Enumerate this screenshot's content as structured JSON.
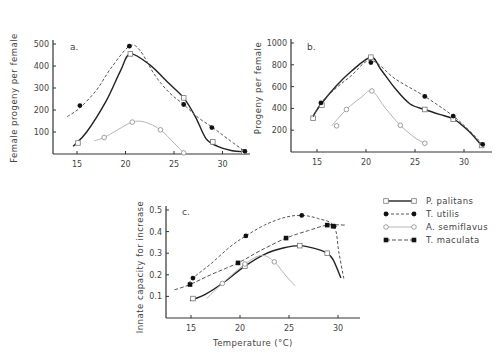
{
  "legend": [
    {
      "key": "P_palitans",
      "label": "P. palitans",
      "line": "solid",
      "marker": "open-square",
      "color": "#222222"
    },
    {
      "key": "T_utilis",
      "label": "T. utilis",
      "line": "dashed",
      "marker": "filled-circle",
      "color": "#555555"
    },
    {
      "key": "A_semiflavus",
      "label": "A. semiflavus",
      "line": "dotted",
      "marker": "open-circle",
      "color": "#aaaaaa"
    },
    {
      "key": "T_maculata",
      "label": "T. maculata",
      "line": "dashed",
      "marker": "filled-square",
      "color": "#555555"
    }
  ],
  "shared_xlabel": "Temperature (°C)",
  "chart_data": [
    {
      "panel": "a.",
      "type": "line",
      "title": "",
      "xlabel": "",
      "ylabel": "Female progeny per female",
      "xlim": [
        13,
        32.5
      ],
      "ylim": [
        0,
        500
      ],
      "xticks": [
        15,
        20,
        25,
        30
      ],
      "yticks": [
        100,
        200,
        300,
        400,
        500
      ],
      "grid": false,
      "series": [
        {
          "name": "P. palitans",
          "points": [
            [
              15.1,
              50
            ],
            [
              20.5,
              455
            ],
            [
              26.0,
              255
            ],
            [
              29.0,
              55
            ],
            [
              32.2,
              10
            ]
          ],
          "curve": [
            [
              14.6,
              35
            ],
            [
              16,
              100
            ],
            [
              18,
              240
            ],
            [
              19.5,
              380
            ],
            [
              20.5,
              455
            ],
            [
              22.5,
              405
            ],
            [
              24.5,
              320
            ],
            [
              26,
              255
            ],
            [
              27.2,
              170
            ],
            [
              28.3,
              70
            ],
            [
              29.5,
              35
            ],
            [
              31,
              15
            ],
            [
              32.2,
              10
            ]
          ]
        },
        {
          "name": "T. utilis",
          "points": [
            [
              15.3,
              220
            ],
            [
              20.4,
              490
            ],
            [
              26.0,
              225
            ],
            [
              28.9,
              120
            ],
            [
              32.3,
              12
            ]
          ],
          "curve": [
            [
              14,
              170
            ],
            [
              15.3,
              210
            ],
            [
              17,
              290
            ],
            [
              18.5,
              390
            ],
            [
              20.4,
              490
            ],
            [
              21.5,
              470
            ],
            [
              23,
              360
            ],
            [
              24.5,
              280
            ],
            [
              26,
              225
            ],
            [
              27.5,
              165
            ],
            [
              29,
              120
            ],
            [
              30.5,
              70
            ],
            [
              32.3,
              12
            ]
          ]
        },
        {
          "name": "A. semiflavus",
          "points": [
            [
              17.8,
              75
            ],
            [
              20.7,
              145
            ],
            [
              23.6,
              110
            ],
            [
              26.0,
              5
            ]
          ],
          "curve": [
            [
              16.8,
              60
            ],
            [
              17.8,
              75
            ],
            [
              19.2,
              110
            ],
            [
              20.7,
              145
            ],
            [
              22,
              145
            ],
            [
              23.6,
              110
            ],
            [
              25,
              50
            ],
            [
              26,
              5
            ]
          ]
        }
      ]
    },
    {
      "panel": "b.",
      "type": "line",
      "title": "",
      "xlabel": "",
      "ylabel": "Progeny per female",
      "xlim": [
        12.5,
        32.5
      ],
      "ylim": [
        0,
        1000
      ],
      "xticks": [
        15,
        20,
        25,
        30
      ],
      "yticks": [
        200,
        400,
        600,
        800,
        1000
      ],
      "grid": false,
      "series": [
        {
          "name": "P. palitans",
          "points": [
            [
              14.6,
              310
            ],
            [
              15.5,
              430
            ],
            [
              20.5,
              870
            ],
            [
              26.0,
              390
            ],
            [
              28.9,
              300
            ],
            [
              31.8,
              60
            ]
          ],
          "curve": [
            [
              14.6,
              330
            ],
            [
              15.5,
              450
            ],
            [
              17,
              610
            ],
            [
              18.5,
              740
            ],
            [
              20.5,
              870
            ],
            [
              21.5,
              760
            ],
            [
              23,
              580
            ],
            [
              24.5,
              440
            ],
            [
              26,
              390
            ],
            [
              27.5,
              345
            ],
            [
              29,
              300
            ],
            [
              30.5,
              190
            ],
            [
              31.8,
              60
            ]
          ]
        },
        {
          "name": "T. utilis",
          "points": [
            [
              15.4,
              450
            ],
            [
              20.5,
              820
            ],
            [
              26.0,
              510
            ],
            [
              28.9,
              330
            ],
            [
              31.9,
              70
            ]
          ],
          "curve": [
            [
              14.6,
              320
            ],
            [
              15.4,
              450
            ],
            [
              17,
              590
            ],
            [
              18.5,
              700
            ],
            [
              20.5,
              840
            ],
            [
              23,
              670
            ],
            [
              26,
              510
            ],
            [
              28.9,
              330
            ],
            [
              30.5,
              200
            ],
            [
              31.9,
              70
            ]
          ]
        },
        {
          "name": "A. semiflavus",
          "points": [
            [
              17.0,
              240
            ],
            [
              18.0,
              390
            ],
            [
              20.6,
              560
            ],
            [
              23.5,
              245
            ],
            [
              26.0,
              80
            ]
          ],
          "curve": [
            [
              16.5,
              240
            ],
            [
              18,
              390
            ],
            [
              19.5,
              500
            ],
            [
              20.6,
              560
            ],
            [
              22,
              400
            ],
            [
              23.5,
              245
            ],
            [
              25,
              130
            ],
            [
              26,
              80
            ]
          ]
        }
      ]
    },
    {
      "panel": "c.",
      "type": "line",
      "title": "",
      "xlabel": "Temperature (°C)",
      "ylabel": "Innate capacity for increase",
      "xlim": [
        12.5,
        32.5
      ],
      "ylim": [
        0,
        0.5
      ],
      "xticks": [
        15,
        20,
        25,
        30
      ],
      "yticks": [
        0.1,
        0.2,
        0.3,
        0.4,
        0.5
      ],
      "grid": false,
      "series": [
        {
          "name": "P. palitans",
          "points": [
            [
              15.2,
              0.09
            ],
            [
              20.5,
              0.24
            ],
            [
              26.1,
              0.335
            ],
            [
              28.9,
              0.3
            ]
          ],
          "curve": [
            [
              14.9,
              0.08
            ],
            [
              16.5,
              0.11
            ],
            [
              18.5,
              0.17
            ],
            [
              20.5,
              0.24
            ],
            [
              22.5,
              0.295
            ],
            [
              24.5,
              0.325
            ],
            [
              26.1,
              0.335
            ],
            [
              27.8,
              0.32
            ],
            [
              28.9,
              0.3
            ],
            [
              29.5,
              0.27
            ],
            [
              30.3,
              0.185
            ]
          ]
        },
        {
          "name": "T. utilis",
          "points": [
            [
              15.2,
              0.185
            ],
            [
              20.6,
              0.38
            ],
            [
              26.3,
              0.475
            ],
            [
              29.6,
              0.425
            ]
          ],
          "curve": [
            [
              14.8,
              0.16
            ],
            [
              15.2,
              0.185
            ],
            [
              17,
              0.25
            ],
            [
              19,
              0.33
            ],
            [
              20.6,
              0.38
            ],
            [
              22.5,
              0.43
            ],
            [
              24.5,
              0.465
            ],
            [
              26.3,
              0.475
            ],
            [
              28,
              0.46
            ],
            [
              29.6,
              0.425
            ],
            [
              30.1,
              0.3
            ],
            [
              30.6,
              0.18
            ]
          ]
        },
        {
          "name": "A. semiflavus",
          "points": [
            [
              18.2,
              0.16
            ],
            [
              20.5,
              0.25
            ],
            [
              23.5,
              0.26
            ]
          ],
          "curve": [
            [
              16.6,
              0.09
            ],
            [
              18.2,
              0.16
            ],
            [
              20.5,
              0.25
            ],
            [
              22.2,
              0.29
            ],
            [
              23.5,
              0.26
            ],
            [
              24.6,
              0.2
            ],
            [
              25.6,
              0.15
            ]
          ]
        },
        {
          "name": "T. maculata",
          "points": [
            [
              14.9,
              0.155
            ],
            [
              19.8,
              0.255
            ],
            [
              24.7,
              0.37
            ],
            [
              28.9,
              0.43
            ],
            [
              29.5,
              0.425
            ]
          ],
          "curve": [
            [
              13.3,
              0.13
            ],
            [
              14.9,
              0.155
            ],
            [
              17,
              0.2
            ],
            [
              19.8,
              0.255
            ],
            [
              22,
              0.31
            ],
            [
              24.7,
              0.37
            ],
            [
              27,
              0.405
            ],
            [
              28.9,
              0.43
            ],
            [
              30.7,
              0.43
            ]
          ]
        }
      ]
    }
  ]
}
